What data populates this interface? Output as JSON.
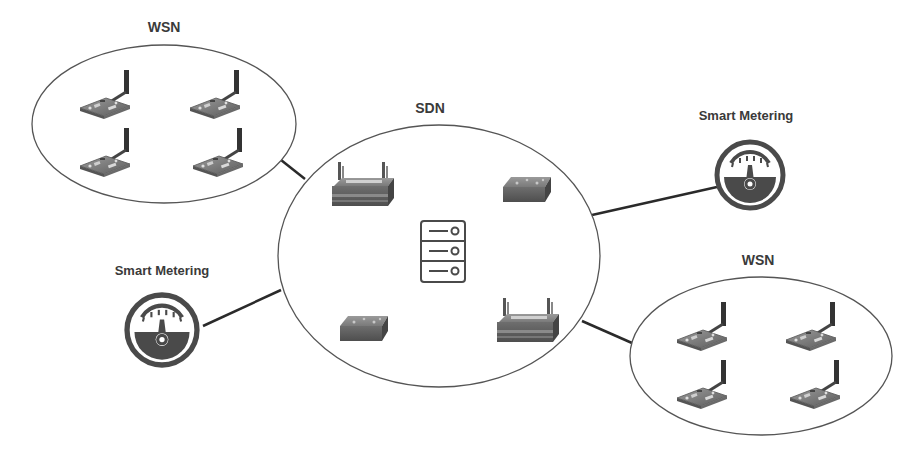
{
  "diagram": {
    "colors": {
      "outline": "#555555",
      "link": "#2a2a2a",
      "device_dark": "#5a5a5a",
      "device_mid": "#7a7a7a",
      "device_light": "#a9a9a9",
      "meter": "#4a4a4a",
      "label": "#3a3a3a"
    },
    "clusters": [
      {
        "id": "wsn-top-left",
        "label": "WSN",
        "cx": 164,
        "cy": 124,
        "rx": 132,
        "ry": 79,
        "label_x": 164,
        "label_y": 19,
        "sensors": [
          {
            "x": 80,
            "y": 70
          },
          {
            "x": 190,
            "y": 70
          },
          {
            "x": 80,
            "y": 128
          },
          {
            "x": 193,
            "y": 128
          }
        ]
      },
      {
        "id": "sdn-center",
        "label": "SDN",
        "cx": 439,
        "cy": 256,
        "rx": 161,
        "ry": 131,
        "label_x": 430,
        "label_y": 100
      },
      {
        "id": "wsn-bottom-right",
        "label": "WSN",
        "cx": 761,
        "cy": 356,
        "rx": 131,
        "ry": 79,
        "label_x": 758,
        "label_y": 252,
        "sensors": [
          {
            "x": 677,
            "y": 302
          },
          {
            "x": 786,
            "y": 302
          },
          {
            "x": 677,
            "y": 360
          },
          {
            "x": 790,
            "y": 360
          }
        ]
      }
    ],
    "meters": [
      {
        "id": "smart-meter-right",
        "label": "Smart Metering",
        "cx": 750,
        "cy": 175,
        "r": 33,
        "label_x": 746,
        "label_y": 108
      },
      {
        "id": "smart-meter-left",
        "label": "Smart Metering",
        "cx": 162,
        "cy": 330,
        "r": 35,
        "label_x": 162,
        "label_y": 263
      }
    ],
    "sdn_devices": [
      {
        "type": "router",
        "x": 330,
        "y": 160,
        "w": 66,
        "h": 48
      },
      {
        "type": "switch",
        "x": 503,
        "y": 177,
        "w": 48,
        "h": 25
      },
      {
        "type": "server",
        "x": 420,
        "y": 220,
        "w": 46,
        "h": 63
      },
      {
        "type": "switch",
        "x": 340,
        "y": 316,
        "w": 48,
        "h": 25
      },
      {
        "type": "router",
        "x": 495,
        "y": 296,
        "w": 66,
        "h": 48
      }
    ],
    "links": [
      {
        "from": "wsn-top-left",
        "to": "sdn-center",
        "x1": 281,
        "y1": 160,
        "x2": 305,
        "y2": 179
      },
      {
        "from": "smart-meter-left",
        "to": "sdn-center",
        "x1": 203,
        "y1": 326,
        "x2": 281,
        "y2": 290
      },
      {
        "from": "sdn-center",
        "to": "smart-meter-right",
        "x1": 592,
        "y1": 215,
        "x2": 717,
        "y2": 187
      },
      {
        "from": "sdn-center",
        "to": "wsn-bottom-right",
        "x1": 582,
        "y1": 321,
        "x2": 632,
        "y2": 343
      }
    ]
  }
}
